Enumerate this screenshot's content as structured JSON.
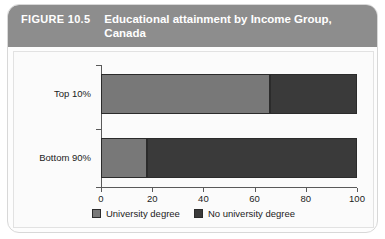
{
  "figure": {
    "number_label": "FIGURE 10.5",
    "title": "Educational attainment by Income Group, Canada"
  },
  "chart_data": {
    "type": "bar",
    "orientation": "horizontal",
    "stacked": true,
    "title": "Educational attainment by Income Group, Canada",
    "xlabel": "",
    "ylabel": "",
    "xlim": [
      0,
      100
    ],
    "xticks": [
      0,
      20,
      40,
      60,
      80,
      100
    ],
    "xtick_labels": [
      "0",
      "20",
      "40",
      "60",
      "80",
      "100"
    ],
    "categories": [
      "Top 10%",
      "Bottom 90%"
    ],
    "grid": false,
    "legend_position": "bottom",
    "series": [
      {
        "name": "University degree",
        "color": "#787878",
        "values": [
          66,
          18
        ]
      },
      {
        "name": "No university degree",
        "color": "#3a3a3a",
        "values": [
          34,
          82
        ]
      }
    ]
  },
  "colors": {
    "header_background": "#8d8d8d",
    "header_text": "#ffffff",
    "card_background": "#fdfdfd",
    "plot_background": "#fbfbfb",
    "axis": "#5a5a5a",
    "light_segment": "#787878",
    "dark_segment": "#3a3a3a"
  }
}
